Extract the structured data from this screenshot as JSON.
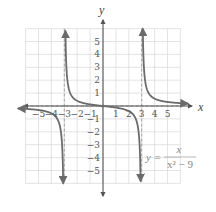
{
  "chart_data": {
    "type": "line",
    "title": "",
    "function": "y = x / (x^2 - 9)",
    "equation_label": {
      "lhs": "y =",
      "numerator": "x",
      "denominator": "x² − 9"
    },
    "xlabel": "x",
    "ylabel": "y",
    "xlim": [
      -6,
      6
    ],
    "ylim": [
      -6,
      6
    ],
    "grid": true,
    "x_ticks": [
      -5,
      -4,
      -3,
      -2,
      -1,
      1,
      2,
      3,
      4,
      5
    ],
    "y_ticks": [
      -5,
      -4,
      -3,
      -2,
      -1,
      1,
      2,
      3,
      4,
      5
    ],
    "x_tick_labels": [
      "−5",
      "−4",
      "−3",
      "−2",
      "−1",
      "1",
      "2",
      "3",
      "4",
      "5"
    ],
    "y_tick_labels": [
      "−5",
      "−4",
      "−3",
      "−2",
      "−1",
      "1",
      "2",
      "3",
      "4",
      "5"
    ],
    "vertical_asymptotes": [
      -3,
      3
    ],
    "horizontal_asymptote": 0,
    "series": [
      {
        "name": "left branch (x < -3)",
        "x": [
          -6.5,
          -6,
          -5,
          -4,
          -3.5,
          -3.2,
          -3.1
        ],
        "y": [
          -0.196,
          -0.222,
          -0.3125,
          -0.571,
          -1.077,
          -2.58,
          -5.08
        ]
      },
      {
        "name": "middle branch (-3 < x < 3)",
        "x": [
          -2.9,
          -2.8,
          -2.5,
          -2,
          -1,
          0,
          1,
          2,
          2.5,
          2.8,
          2.9
        ],
        "y": [
          4.93,
          2.41,
          0.909,
          0.4,
          0.125,
          0,
          -0.125,
          -0.4,
          -0.909,
          -2.41,
          -4.93
        ]
      },
      {
        "name": "right branch (x > 3)",
        "x": [
          3.1,
          3.2,
          3.5,
          4,
          5,
          6,
          6.5
        ],
        "y": [
          5.08,
          2.58,
          1.077,
          0.571,
          0.3125,
          0.222,
          0.196
        ]
      }
    ],
    "colors": {
      "curve": "#6b6b6b",
      "axes": "#555555",
      "grid": "#d8d8d8",
      "asymptote": "#9a9a9a"
    }
  }
}
